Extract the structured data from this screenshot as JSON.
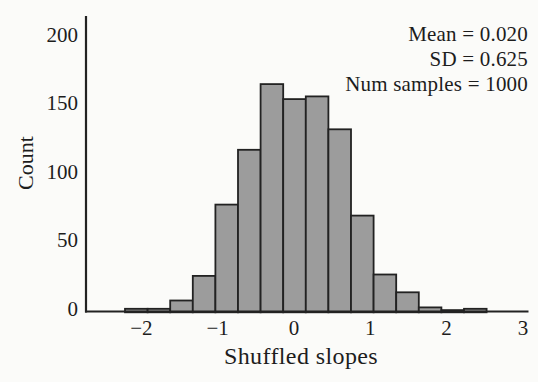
{
  "figure": {
    "background": "#fbfbf9",
    "ink": "#1d1d1d"
  },
  "annotations": {
    "mean": "Mean = 0.020",
    "sd": "SD = 0.625",
    "num_samples": "Num samples = 1000"
  },
  "chart_data": {
    "type": "bar",
    "subtype": "histogram",
    "title": "",
    "xlabel": "Shuffled slopes",
    "ylabel": "Count",
    "x_ticks": [
      -2,
      -1,
      0,
      1,
      2,
      3
    ],
    "x_tick_labels": [
      "−2",
      "−1",
      "0",
      "1",
      "2",
      "3"
    ],
    "y_ticks": [
      0,
      50,
      100,
      150,
      200
    ],
    "y_tick_labels": [
      "0",
      "50",
      "100",
      "150",
      "200"
    ],
    "xlim": [
      -2.9,
      3.07
    ],
    "ylim": [
      0,
      215
    ],
    "grid": false,
    "legend": "none",
    "bin_start": -2.215,
    "bin_width": 0.2962,
    "counts": [
      2,
      2,
      8,
      26,
      78,
      118,
      166,
      155,
      157,
      133,
      70,
      27,
      14,
      3,
      1,
      2
    ],
    "stats": {
      "mean": 0.02,
      "sd": 0.625,
      "num_samples": 1000
    },
    "bar_fill": "#9c9c9c",
    "bar_stroke": "#222222",
    "axis_color": "#222222"
  }
}
